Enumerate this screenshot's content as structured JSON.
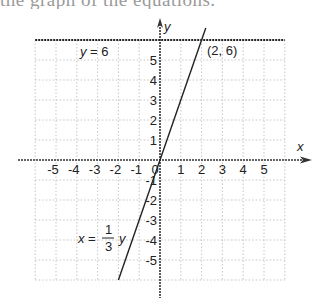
{
  "caption": {
    "text": "the graph of the equations."
  },
  "chart_data": {
    "type": "line",
    "title": "",
    "xlabel": "x",
    "ylabel": "y",
    "xlim": [
      -6,
      6
    ],
    "ylim": [
      -6,
      6
    ],
    "grid": true,
    "grid_style": "dotted",
    "x_ticks": [
      "-5",
      "-4",
      "-3",
      "-2",
      "-1",
      "0",
      "1",
      "2",
      "3",
      "4",
      "5"
    ],
    "y_ticks": [
      "5",
      "4",
      "3",
      "2",
      "1",
      "-1",
      "-2",
      "-3",
      "-4",
      "-5"
    ],
    "origin_label": "0",
    "series": [
      {
        "name": "x = 1/3 y",
        "type": "line",
        "x": [
          -2,
          2.2
        ],
        "y": [
          -6,
          6.6
        ],
        "color": "#222222"
      },
      {
        "name": "y = 6",
        "type": "line",
        "x": [
          -6,
          6
        ],
        "y": [
          6,
          6
        ],
        "color": "#222222",
        "style": "dashed-thick"
      }
    ],
    "annotations": [
      {
        "text": "y = 6",
        "x": -4.2,
        "y": 5.3
      },
      {
        "text": "(2, 6)",
        "x": 3.0,
        "y": 5.5
      },
      {
        "text": "x = 1/3 y",
        "x": -3.4,
        "y": -3.7
      }
    ],
    "labels": {
      "y_eq_6": "y = 6",
      "point": "(2, 6)",
      "line_eq_lhs": "x =",
      "line_eq_num": "1",
      "line_eq_den": "3",
      "line_eq_rhs": "y",
      "x_axis": "x",
      "y_axis": "y"
    }
  }
}
